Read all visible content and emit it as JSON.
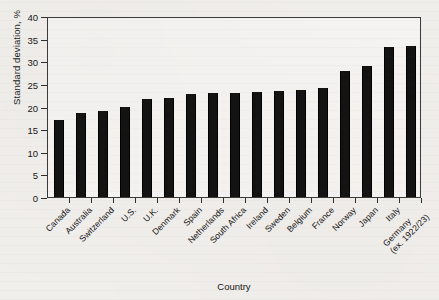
{
  "chart_data": {
    "type": "bar",
    "title": "",
    "xlabel": "Country",
    "ylabel": "Standard deviation, %",
    "ylim": [
      0,
      40
    ],
    "yticks": [
      0,
      5,
      10,
      15,
      20,
      25,
      30,
      35,
      40
    ],
    "grid": false,
    "legend": null,
    "bar_color": "#121212",
    "categories": [
      "Canada",
      "Australia",
      "Switzerland",
      "U.S.",
      "U.K.",
      "Denmark",
      "Spain",
      "Netherlands",
      "South Africa",
      "Ireland",
      "Sweden",
      "Belgium",
      "France",
      "Norway",
      "Japan",
      "Italy",
      "Germany (ex. 1922/23)"
    ],
    "category_labels": [
      {
        "line1": "Canada",
        "line2": ""
      },
      {
        "line1": "Australia",
        "line2": ""
      },
      {
        "line1": "Switzerland",
        "line2": ""
      },
      {
        "line1": "U.S.",
        "line2": ""
      },
      {
        "line1": "U.K.",
        "line2": ""
      },
      {
        "line1": "Denmark",
        "line2": ""
      },
      {
        "line1": "Spain",
        "line2": ""
      },
      {
        "line1": "Netherlands",
        "line2": ""
      },
      {
        "line1": "South Africa",
        "line2": ""
      },
      {
        "line1": "Ireland",
        "line2": ""
      },
      {
        "line1": "Sweden",
        "line2": ""
      },
      {
        "line1": "Belgium",
        "line2": ""
      },
      {
        "line1": "France",
        "line2": ""
      },
      {
        "line1": "Norway",
        "line2": ""
      },
      {
        "line1": "Japan",
        "line2": ""
      },
      {
        "line1": "Italy",
        "line2": ""
      },
      {
        "line1": "Germany",
        "line2": "(ex. 1922/23)"
      }
    ],
    "values": [
      17.0,
      18.5,
      19.1,
      20.0,
      21.6,
      21.9,
      22.7,
      22.9,
      23.0,
      23.2,
      23.4,
      23.6,
      24.2,
      27.8,
      29.0,
      33.2,
      33.3
    ]
  }
}
